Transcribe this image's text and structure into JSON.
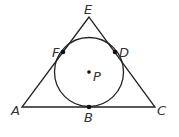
{
  "diagram": {
    "stroke_color": "#222222",
    "points": {
      "A": {
        "label": "A"
      },
      "B": {
        "label": "B"
      },
      "C": {
        "label": "C"
      },
      "D": {
        "label": "D"
      },
      "E": {
        "label": "E"
      },
      "F": {
        "label": "F"
      },
      "P": {
        "label": "P"
      }
    }
  }
}
